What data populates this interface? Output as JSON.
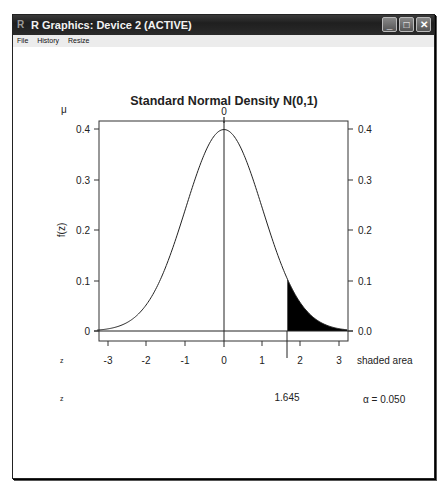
{
  "window": {
    "title": "R Graphics: Device 2 (ACTIVE)",
    "buttons": {
      "minimize": "_",
      "maximize": "□",
      "close": "✕"
    },
    "menu": [
      {
        "label": "File"
      },
      {
        "label": "History"
      },
      {
        "label": "Resize"
      }
    ]
  },
  "plot": {
    "title": "Standard Normal Density N(0,1)",
    "mu_label": "μ",
    "top_tick_label": "0",
    "ylabel": "f(z)",
    "z_row1_label": "z",
    "z_row2_label": "z",
    "shaded_area_label": "shaded area",
    "critical_value_label": "1.645",
    "alpha_label": "α = 0.050",
    "left_ytick_labels": [
      "0",
      "0.1",
      "0.2",
      "0.3",
      "0.4"
    ],
    "right_ytick_labels": [
      "0.0",
      "0.1",
      "0.2",
      "0.3",
      "0.4"
    ],
    "xtick_labels": [
      "-3",
      "-2",
      "-1",
      "0",
      "1",
      "2",
      "3"
    ]
  },
  "chart_data": {
    "type": "area",
    "title": "Standard Normal Density N(0,1)",
    "xlabel": "z",
    "ylabel": "f(z)",
    "xlim": [
      -3.3,
      3.2
    ],
    "ylim": [
      0,
      0.41
    ],
    "x_ticks": [
      -3,
      -2,
      -1,
      0,
      1,
      2,
      3
    ],
    "y_ticks_left": [
      0,
      0.1,
      0.2,
      0.3,
      0.4
    ],
    "y_ticks_right": [
      0.0,
      0.1,
      0.2,
      0.3,
      0.4
    ],
    "top_axis": {
      "label": "μ",
      "ticks": [
        0
      ]
    },
    "grid": false,
    "series": [
      {
        "name": "N(0,1) density",
        "x": [
          -3.3,
          -3,
          -2.5,
          -2,
          -1.5,
          -1,
          -0.5,
          0,
          0.5,
          1,
          1.5,
          1.645,
          2,
          2.5,
          3,
          3.2
        ],
        "values": [
          0.0017,
          0.0044,
          0.0175,
          0.054,
          0.1295,
          0.242,
          0.3521,
          0.3989,
          0.3521,
          0.242,
          0.1295,
          0.1031,
          0.054,
          0.0175,
          0.0044,
          0.0024
        ]
      }
    ],
    "shaded_region": {
      "from": 1.645,
      "to": 3.2,
      "tail": "upper",
      "area": 0.05
    },
    "annotations": [
      {
        "text": "1.645",
        "position": "below axis at z = 1.645"
      },
      {
        "text": "α = 0.050",
        "position": "bottom right"
      },
      {
        "text": "shaded area",
        "position": "right of x-axis"
      }
    ]
  }
}
